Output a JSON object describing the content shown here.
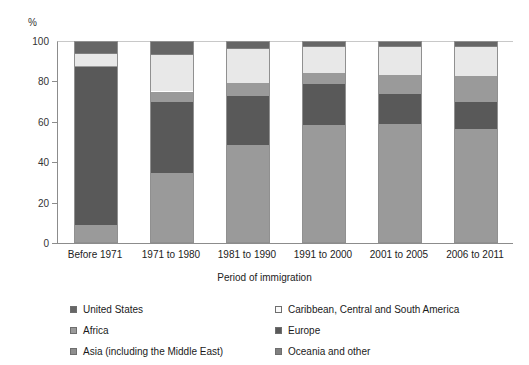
{
  "chart_data": {
    "type": "bar",
    "subtype": "stacked-bar-100",
    "title": "",
    "xlabel": "Period of immigration",
    "ylabel": "%",
    "ylim": [
      0,
      100
    ],
    "yticks": [
      0,
      20,
      40,
      60,
      80,
      100
    ],
    "grid": false,
    "legend_position": "bottom",
    "categories": [
      "Before 1971",
      "1971 to 1980",
      "1981 to 1990",
      "1991 to 2000",
      "2001 to 2005",
      "2006 to 2011"
    ],
    "series": [
      {
        "name": "Asia (including the Middle East)",
        "color": "#9a9a9a",
        "values": [
          9.0,
          34.5,
          48.5,
          58.5,
          59.0,
          56.5
        ]
      },
      {
        "name": "Europe",
        "color": "#595959",
        "values": [
          78.0,
          35.5,
          24.5,
          20.0,
          15.0,
          13.5
        ]
      },
      {
        "name": "Africa",
        "color": "#9a9a9a",
        "values": [
          0.5,
          5.0,
          6.0,
          5.5,
          9.0,
          12.5
        ]
      },
      {
        "name": "Caribbean, Central and South America",
        "color": "#e8e8e8",
        "values": [
          6.0,
          18.0,
          17.0,
          13.0,
          14.0,
          14.5
        ]
      },
      {
        "name": "Oceania and other",
        "color": "#7f7f7f",
        "values": [
          0.5,
          0.5,
          0.5,
          0.5,
          0.5,
          0.5
        ]
      },
      {
        "name": "United States",
        "color": "#666666",
        "values": [
          6.0,
          6.5,
          3.5,
          2.5,
          2.5,
          2.5
        ]
      }
    ]
  },
  "axes": {
    "unit_label": "%",
    "y_tick_labels": [
      "100",
      "80",
      "60",
      "40",
      "20",
      "0"
    ],
    "x_axis_title": "Period of immigration",
    "x_tick_labels": [
      "Before 1971",
      "1971 to 1980",
      "1981 to 1990",
      "1991 to 2000",
      "2001 to 2005",
      "2006 to 2011"
    ]
  },
  "legend": {
    "column_left": [
      {
        "label": "United States",
        "color": "#666666"
      },
      {
        "label": "Africa",
        "color": "#9a9a9a"
      },
      {
        "label": "Asia (including the Middle East)",
        "color": "#8e8e8e"
      }
    ],
    "column_right": [
      {
        "label": "Caribbean, Central and South America",
        "color": "#fafafa"
      },
      {
        "label": "Europe",
        "color": "#595959"
      },
      {
        "label": "Oceania and other",
        "color": "#7f7f7f"
      }
    ]
  }
}
